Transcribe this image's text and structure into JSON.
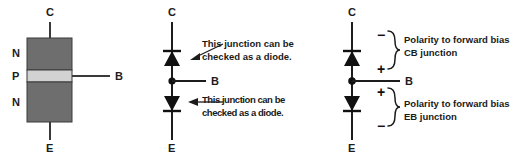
{
  "figure": {
    "background": "#ffffff",
    "ink": "#1c1c1c",
    "block_n_color": "#6e6e6e",
    "block_p_color": "#d2d2d2",
    "block_border": "#3a3a3a"
  },
  "panel_structure": {
    "name": "npn-block-structure",
    "terminals": {
      "collector": "C",
      "base": "B",
      "emitter": "E"
    },
    "layers": [
      {
        "label": "N",
        "region": "collector"
      },
      {
        "label": "P",
        "region": "base"
      },
      {
        "label": "N",
        "region": "emitter"
      }
    ]
  },
  "panel_diodes": {
    "name": "two-diode-equivalent",
    "terminals": {
      "collector": "C",
      "base": "B",
      "emitter": "E"
    },
    "annotations": [
      {
        "name": "cb-junction-note",
        "line1": "This junction can be",
        "line2": "checked as a diode."
      },
      {
        "name": "eb-junction-note",
        "line1": "This junction can be",
        "line2": "checked as a diode."
      }
    ]
  },
  "panel_polarity": {
    "name": "forward-bias-polarity",
    "terminals": {
      "collector": "C",
      "base": "B",
      "emitter": "E"
    },
    "groups": [
      {
        "name": "cb-junction-bias",
        "top_sign": "−",
        "bottom_sign": "+",
        "line1": "Polarity to forward bias",
        "line2": "CB junction"
      },
      {
        "name": "eb-junction-bias",
        "top_sign": "+",
        "bottom_sign": "−",
        "line1": "Polarity to forward bias",
        "line2": "EB junction"
      }
    ]
  }
}
